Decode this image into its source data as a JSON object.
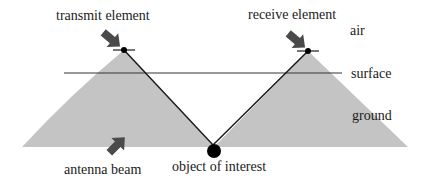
{
  "diagram": {
    "labels": {
      "transmit": "transmit element",
      "receive": "receive element",
      "air": "air",
      "surface": "surface",
      "ground": "ground",
      "beam": "antenna beam",
      "object": "object of interest"
    },
    "colors": {
      "beam_fill": "#c4c4c4",
      "line": "#1a1a1a",
      "arrow": "#4a4a4a",
      "surface_line": "#333333"
    }
  }
}
